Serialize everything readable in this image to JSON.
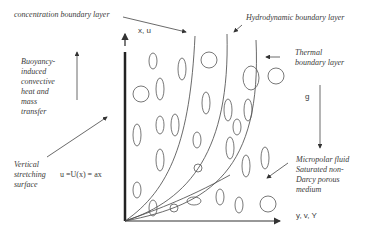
{
  "labels": {
    "concentration": "concentration boundary layer",
    "hydrodynamic": "Hydrodynamic boundary layer",
    "thermal_1": "Thermal",
    "thermal_2": "boundary layer",
    "buoyancy": [
      "Buoyancy-",
      "induced",
      "convective",
      "heat and",
      "mass",
      "transfer"
    ],
    "vertical": [
      "Vertical",
      "stretching",
      "surface"
    ],
    "micropolar": [
      "Micropolar fluid",
      "Saturated non-",
      "Darcy porous",
      "medium"
    ],
    "x_axis": "x, u",
    "y_axis": "y, v, Y",
    "gravity": "g",
    "velocity_eq": "u =U(x) = ax"
  },
  "colors": {
    "line": "#333333",
    "text": "#3a3a3a",
    "background": "#ffffff"
  }
}
